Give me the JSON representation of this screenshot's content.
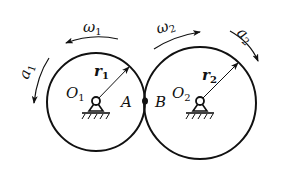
{
  "diagram": {
    "type": "meshing-gears-kinematics",
    "colors": {
      "stroke": "#111111",
      "background": "#ffffff"
    },
    "wheel1": {
      "center_label": "O",
      "center_sub": "1",
      "radius_label": "r",
      "radius_sub": "1",
      "omega_label": "ω",
      "omega_sub": "1",
      "accel_label": "a",
      "accel_sub": "1",
      "contact_label": "A"
    },
    "wheel2": {
      "center_label": "O",
      "center_sub": "2",
      "radius_label": "r",
      "radius_sub": "2",
      "omega_label": "ω",
      "omega_sub": "2",
      "accel_label": "a",
      "accel_sub": "2",
      "contact_label": "B"
    }
  }
}
